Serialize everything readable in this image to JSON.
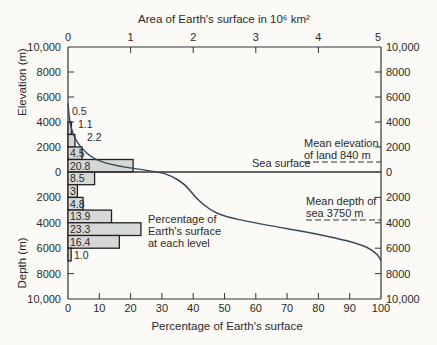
{
  "chart_data": {
    "type": "bar",
    "top_axis": {
      "label": "Area of Earth's surface in 10⁶ km²",
      "ticks": [
        "0",
        "1",
        "2",
        "3",
        "4",
        "5"
      ]
    },
    "bottom_axis": {
      "label": "Percentage of Earth's surface",
      "ticks": [
        "0",
        "10",
        "20",
        "30",
        "40",
        "50",
        "60",
        "70",
        "80",
        "90",
        "100"
      ],
      "range": [
        0,
        100
      ]
    },
    "left_axis": {
      "upper_label": "Elevation (m)",
      "lower_label": "Depth (m)",
      "ticks": [
        "10,000",
        "8000",
        "6000",
        "4000",
        "2000",
        "0",
        "2000",
        "4000",
        "6000",
        "8000",
        "10,000"
      ],
      "range": [
        10000,
        -10000
      ]
    },
    "right_axis": {
      "ticks": [
        "10,000",
        "8000",
        "6000",
        "4000",
        "2000",
        "0",
        "2000",
        "4000",
        "6000",
        "8000",
        "10,000"
      ]
    },
    "series": [
      {
        "name": "Percentage of Earth's surface at each level",
        "type": "bar",
        "bands_m": [
          {
            "from": 5000,
            "to": 4000,
            "value": 0.5
          },
          {
            "from": 4000,
            "to": 3000,
            "value": 1.1
          },
          {
            "from": 3000,
            "to": 2000,
            "value": 2.2
          },
          {
            "from": 2000,
            "to": 1000,
            "value": 4.5
          },
          {
            "from": 1000,
            "to": 0,
            "value": 20.8
          },
          {
            "from": 0,
            "to": -1000,
            "value": 8.5
          },
          {
            "from": -1000,
            "to": -2000,
            "value": 3
          },
          {
            "from": -2000,
            "to": -3000,
            "value": 4.8
          },
          {
            "from": -3000,
            "to": -4000,
            "value": 13.9
          },
          {
            "from": -4000,
            "to": -5000,
            "value": 23.3
          },
          {
            "from": -5000,
            "to": -6000,
            "value": 16.4
          },
          {
            "from": -6000,
            "to": -7000,
            "value": 1.0
          }
        ]
      },
      {
        "name": "Hypsographic curve (cumulative)",
        "type": "line",
        "points": [
          [
            0,
            5500
          ],
          [
            0.5,
            4000
          ],
          [
            1.6,
            3000
          ],
          [
            3.8,
            2000
          ],
          [
            8.3,
            1000
          ],
          [
            15,
            500
          ],
          [
            29.1,
            0
          ],
          [
            33,
            -300
          ],
          [
            37.6,
            -1000
          ],
          [
            40.6,
            -2000
          ],
          [
            45.4,
            -3000
          ],
          [
            50,
            -3500
          ],
          [
            59.3,
            -4000
          ],
          [
            82.6,
            -5000
          ],
          [
            95,
            -5800
          ],
          [
            99,
            -6500
          ],
          [
            100,
            -7000
          ]
        ]
      }
    ],
    "annotations": {
      "sea_surface": "Sea surface",
      "mean_elevation": [
        "Mean elevation",
        "of land 840 m"
      ],
      "mean_depth": [
        "Mean depth of",
        "sea 3750 m"
      ],
      "bar_legend": [
        "Percentage of",
        "Earth's surface",
        "at each level"
      ]
    },
    "bar_labels": [
      "0.5",
      "1.1",
      "2.2",
      "4.5",
      "20.8",
      "8.5",
      "3",
      "4.8",
      "13.9",
      "23.3",
      "16.4",
      "1.0"
    ]
  }
}
